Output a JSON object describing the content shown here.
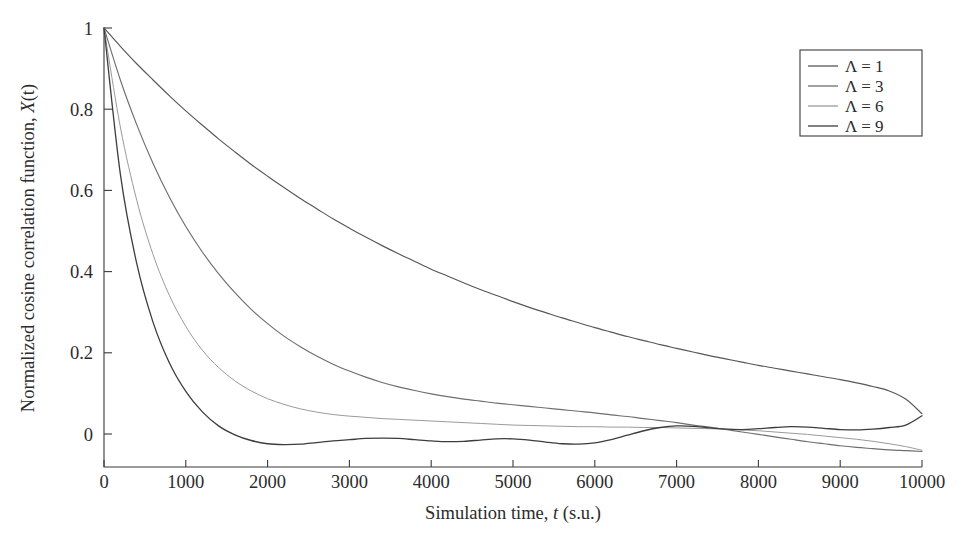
{
  "figure": {
    "background_color": "#ffffff",
    "axis_color": "#3b3b3b",
    "text_color": "#2b2b2b"
  },
  "axes": {
    "x_title_prefix": "Simulation time, ",
    "x_title_var": "t",
    "x_title_suffix": " (s.u.)",
    "y_title_prefix": "Normalized cosine correlation function, ",
    "y_title_var": "X",
    "y_title_suffix": "(t)",
    "x_ticklabels": [
      "0",
      "1000",
      "2000",
      "3000",
      "4000",
      "5000",
      "6000",
      "7000",
      "8000",
      "9000",
      "10000"
    ],
    "y_ticklabels": [
      "0",
      "0.2",
      "0.4",
      "0.6",
      "0.8",
      "1"
    ]
  },
  "legend": {
    "entries": [
      {
        "label": "Λ = 1",
        "color": "#575757"
      },
      {
        "label": "Λ = 3",
        "color": "#6e6e6e"
      },
      {
        "label": "Λ = 6",
        "color": "#9a9a9a"
      },
      {
        "label": "Λ = 9",
        "color": "#3d3d3d"
      }
    ]
  },
  "chart_data": {
    "type": "line",
    "title": "",
    "xlabel": "Simulation time, t (s.u.)",
    "ylabel": "Normalized cosine correlation function, X(t)",
    "xlim": [
      0,
      10000
    ],
    "ylim": [
      -0.065,
      1.0
    ],
    "xticks": [
      0,
      1000,
      2000,
      3000,
      4000,
      5000,
      6000,
      7000,
      8000,
      9000,
      10000
    ],
    "yticks": [
      0,
      0.2,
      0.4,
      0.6,
      0.8,
      1
    ],
    "grid": false,
    "legend_position": "top-right",
    "x": [
      0,
      200,
      400,
      600,
      800,
      1000,
      1200,
      1400,
      1600,
      1800,
      2000,
      2200,
      2400,
      2600,
      2800,
      3000,
      3200,
      3400,
      3600,
      3800,
      4000,
      4200,
      4400,
      4600,
      4800,
      5000,
      5200,
      5400,
      5600,
      5800,
      6000,
      6200,
      6400,
      6600,
      6800,
      7000,
      7200,
      7400,
      7600,
      7800,
      8000,
      8200,
      8400,
      8600,
      8800,
      9000,
      9200,
      9400,
      9600,
      9800,
      10000
    ],
    "series": [
      {
        "name": "Λ = 1",
        "color": "#575757",
        "values": [
          1.0,
          0.955,
          0.912,
          0.872,
          0.833,
          0.796,
          0.761,
          0.727,
          0.695,
          0.664,
          0.635,
          0.607,
          0.58,
          0.555,
          0.53,
          0.507,
          0.485,
          0.464,
          0.444,
          0.425,
          0.406,
          0.389,
          0.372,
          0.356,
          0.341,
          0.326,
          0.312,
          0.299,
          0.286,
          0.274,
          0.262,
          0.251,
          0.24,
          0.23,
          0.22,
          0.211,
          0.202,
          0.193,
          0.185,
          0.177,
          0.169,
          0.162,
          0.155,
          0.148,
          0.141,
          0.134,
          0.126,
          0.117,
          0.106,
          0.086,
          0.05
        ]
      },
      {
        "name": "Λ = 3",
        "color": "#6e6e6e",
        "values": [
          1.0,
          0.872,
          0.762,
          0.666,
          0.583,
          0.511,
          0.449,
          0.395,
          0.348,
          0.307,
          0.272,
          0.241,
          0.215,
          0.192,
          0.172,
          0.155,
          0.14,
          0.127,
          0.116,
          0.107,
          0.099,
          0.092,
          0.086,
          0.081,
          0.076,
          0.072,
          0.068,
          0.064,
          0.06,
          0.056,
          0.052,
          0.047,
          0.043,
          0.038,
          0.033,
          0.028,
          0.022,
          0.017,
          0.011,
          0.005,
          -0.001,
          -0.007,
          -0.013,
          -0.019,
          -0.024,
          -0.029,
          -0.033,
          -0.036,
          -0.039,
          -0.041,
          -0.043
        ]
      },
      {
        "name": "Λ = 6",
        "color": "#9a9a9a",
        "values": [
          1.0,
          0.756,
          0.576,
          0.442,
          0.341,
          0.265,
          0.207,
          0.164,
          0.131,
          0.106,
          0.087,
          0.073,
          0.062,
          0.054,
          0.048,
          0.044,
          0.041,
          0.038,
          0.036,
          0.034,
          0.032,
          0.03,
          0.028,
          0.026,
          0.024,
          0.022,
          0.021,
          0.02,
          0.019,
          0.018,
          0.018,
          0.017,
          0.017,
          0.016,
          0.016,
          0.015,
          0.014,
          0.013,
          0.012,
          0.01,
          0.008,
          0.005,
          0.002,
          -0.001,
          -0.005,
          -0.009,
          -0.013,
          -0.018,
          -0.024,
          -0.031,
          -0.04
        ]
      },
      {
        "name": "Λ = 9",
        "color": "#3d3d3d",
        "values": [
          1.0,
          0.64,
          0.42,
          0.275,
          0.175,
          0.105,
          0.055,
          0.02,
          -0.002,
          -0.016,
          -0.024,
          -0.026,
          -0.025,
          -0.021,
          -0.017,
          -0.014,
          -0.011,
          -0.01,
          -0.011,
          -0.014,
          -0.017,
          -0.019,
          -0.018,
          -0.015,
          -0.012,
          -0.012,
          -0.015,
          -0.02,
          -0.024,
          -0.025,
          -0.022,
          -0.014,
          -0.003,
          0.008,
          0.016,
          0.02,
          0.019,
          0.015,
          0.012,
          0.011,
          0.013,
          0.016,
          0.018,
          0.017,
          0.014,
          0.011,
          0.01,
          0.012,
          0.016,
          0.022,
          0.045
        ]
      }
    ]
  }
}
